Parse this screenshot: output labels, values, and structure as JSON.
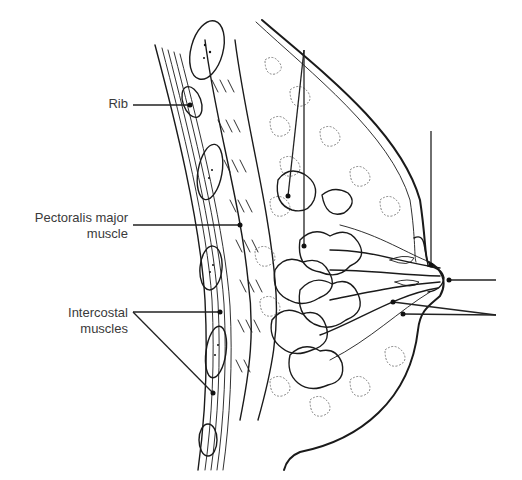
{
  "diagram": {
    "type": "anatomical-cross-section",
    "labels": [
      {
        "id": "rib",
        "text": "Rib",
        "lines": [
          "Rib"
        ]
      },
      {
        "id": "pectoralis",
        "text": "Pectoralis major muscle",
        "lines": [
          "Pectoralis major",
          "muscle"
        ]
      },
      {
        "id": "intercostal",
        "text": "Intercostal muscles",
        "lines": [
          "Intercostal",
          "muscles"
        ]
      }
    ],
    "unlabeled_leaders": [
      {
        "id": "top-leader-lobules",
        "target": "lobules"
      },
      {
        "id": "top-right-leader-areola",
        "target": "areola"
      },
      {
        "id": "right-leader-nipple",
        "target": "nipple"
      },
      {
        "id": "right-leader-ducts",
        "target": "lactiferous ducts / sinuses"
      }
    ]
  }
}
